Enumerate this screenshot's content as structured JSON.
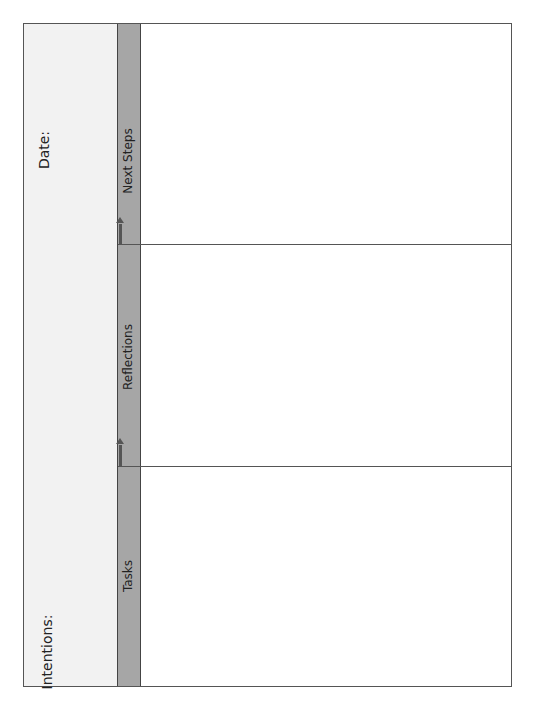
{
  "left_panel": {
    "date_label": "Date:",
    "intentions_label": "Intentions:"
  },
  "sections": [
    {
      "label": "Next Steps"
    },
    {
      "label": "Reflections"
    },
    {
      "label": "Tasks"
    }
  ],
  "colors": {
    "strip": "#a6a6a6",
    "left_panel": "#f2f2f2",
    "border": "#555555"
  }
}
